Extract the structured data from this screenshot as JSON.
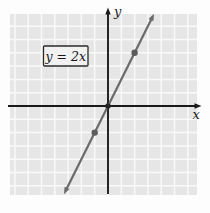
{
  "figure": {
    "equation_label": "y = 2x",
    "x_axis_label": "x",
    "y_axis_label": "y"
  },
  "chart_data": {
    "type": "line",
    "title": "",
    "equation": "y = 2x",
    "slope": 2,
    "intercept": 0,
    "marked_points": [
      [
        -1,
        -2
      ],
      [
        0,
        0
      ],
      [
        2,
        4
      ]
    ],
    "x_range_shown": [
      -7.5,
      6.7
    ],
    "y_range_shown": [
      -6.7,
      6.9
    ],
    "grid": true,
    "legend": "none",
    "axis_labels": {
      "x": "x",
      "y": "y"
    },
    "colors": {
      "grid_bg": "#e6e6e6",
      "grid_line": "#f9f9f9",
      "axes": "#1a1a1a",
      "line": "#6b6b6b",
      "point": "#5c5c5c",
      "origin_point": "#222222",
      "label_box_bg": "#f1f1f1",
      "label_box_border": "#2a2a2a"
    },
    "layout": {
      "canvas": {
        "w": 210,
        "h": 213
      },
      "plot": {
        "x": 10,
        "y": 14,
        "w": 187,
        "h": 181
      },
      "origin_px": {
        "x": 108,
        "y": 106
      },
      "unit_px": 13.3,
      "line_y_top_px": 17,
      "line_y_bottom_px": 191,
      "equation_box": {
        "x": 43.5,
        "y": 46,
        "w": 44.5,
        "h": 20
      }
    }
  }
}
